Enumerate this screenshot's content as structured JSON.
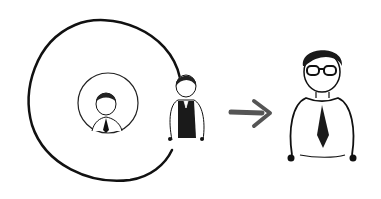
{
  "illustration": {
    "description": "Hand-drawn illustration: a small person inside an inner circle, a person in a dark vest standing at the edge of a large circle, a gray arrow pointing right, and a larger person with glasses and a tie",
    "colors": {
      "ink": "#111111",
      "arrow": "#555555",
      "background": "#ffffff"
    }
  }
}
